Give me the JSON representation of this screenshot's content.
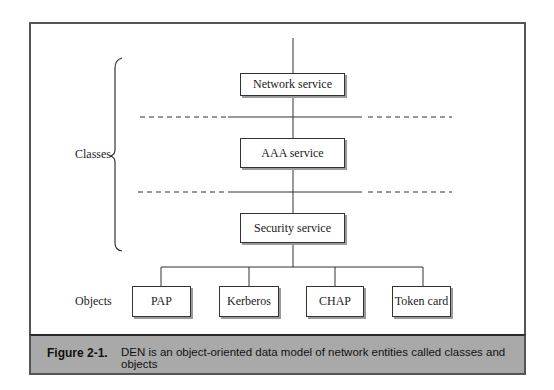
{
  "figure": {
    "classes_label": "Classes",
    "objects_label": "Objects",
    "classes": [
      {
        "label": "Network service"
      },
      {
        "label": "AAA service"
      },
      {
        "label": "Security service"
      }
    ],
    "objects": [
      {
        "label": "PAP"
      },
      {
        "label": "Kerberos"
      },
      {
        "label": "CHAP"
      },
      {
        "label": "Token card"
      }
    ]
  },
  "caption": {
    "number": "Figure 2-1.",
    "text": "DEN is an object-oriented data model of network entities called classes and objects"
  },
  "colors": {
    "caption_bg": "#a9a9a9",
    "line": "#333333",
    "frame": "#555555"
  }
}
